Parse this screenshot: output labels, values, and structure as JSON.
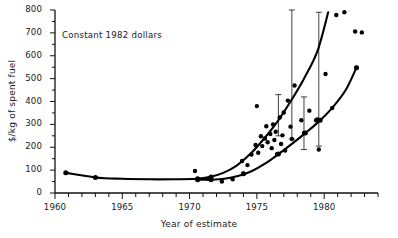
{
  "chart_data": {
    "type": "scatter",
    "title": "",
    "annotation": "Constant 1982 dollars",
    "xlabel": "Year of estimate",
    "ylabel": "$/kg of spent fuel",
    "xlim": [
      1960,
      1984
    ],
    "ylim": [
      0,
      800
    ],
    "xticks_major": [
      1960,
      1965,
      1970,
      1975,
      1980
    ],
    "xticks_minor_interval": 1,
    "yticks_major": [
      0,
      100,
      200,
      300,
      400,
      500,
      600,
      700,
      800
    ],
    "yticks_minor_interval": 50,
    "grid": false,
    "legend": "none",
    "axis_color": "#111111",
    "series": [
      {
        "name": "upper-trend-curve",
        "type": "line",
        "x": [
          1960.8,
          1963.0,
          1965.0,
          1967.0,
          1969.0,
          1970.5,
          1971.5,
          1972.5,
          1973.5,
          1974.5,
          1975.5,
          1976.5,
          1977.5,
          1978.5,
          1979.5,
          1980.3
        ],
        "y": [
          88,
          68,
          62,
          60,
          60,
          62,
          70,
          88,
          120,
          170,
          235,
          310,
          400,
          500,
          620,
          790
        ],
        "markers_at": [
          [
            1960.8,
            88
          ],
          [
            1963.0,
            68
          ],
          [
            1970.6,
            62
          ],
          [
            1971.6,
            70
          ]
        ]
      },
      {
        "name": "lower-trend-curve",
        "type": "line",
        "x": [
          1970.6,
          1971.6,
          1972.6,
          1973.6,
          1974.6,
          1975.6,
          1976.6,
          1977.6,
          1978.6,
          1979.6,
          1980.6,
          1981.6,
          1982.4
        ],
        "y": [
          58,
          58,
          62,
          74,
          95,
          128,
          170,
          215,
          262,
          312,
          372,
          450,
          548
        ],
        "markers_at": [
          [
            1970.6,
            58
          ],
          [
            1971.6,
            58
          ],
          [
            1974.0,
            84
          ],
          [
            1976.6,
            170
          ],
          [
            1978.6,
            262
          ],
          [
            1979.7,
            318
          ],
          [
            1982.4,
            548
          ]
        ]
      },
      {
        "name": "cost-estimate-points",
        "type": "scatter",
        "points": [
          [
            1970.4,
            96
          ],
          [
            1971.4,
            62
          ],
          [
            1972.4,
            50
          ],
          [
            1973.2,
            60
          ],
          [
            1974.0,
            84
          ],
          [
            1974.3,
            122
          ],
          [
            1974.6,
            168
          ],
          [
            1974.9,
            210
          ],
          [
            1975.1,
            176
          ],
          [
            1975.3,
            248
          ],
          [
            1975.4,
            205
          ],
          [
            1975.6,
            238
          ],
          [
            1975.7,
            292
          ],
          [
            1975.8,
            222
          ],
          [
            1976.0,
            258
          ],
          [
            1976.1,
            196
          ],
          [
            1976.2,
            300
          ],
          [
            1976.3,
            232
          ],
          [
            1976.4,
            268
          ],
          [
            1976.5,
            170
          ],
          [
            1976.7,
            330
          ],
          [
            1976.8,
            214
          ],
          [
            1976.9,
            252
          ],
          [
            1977.0,
            352
          ],
          [
            1977.1,
            186
          ],
          [
            1977.3,
            404
          ],
          [
            1977.5,
            290
          ],
          [
            1977.6,
            236
          ],
          [
            1977.8,
            470
          ],
          [
            1978.3,
            318
          ],
          [
            1978.5,
            262
          ],
          [
            1978.9,
            360
          ],
          [
            1979.4,
            318
          ],
          [
            1979.5,
            322
          ],
          [
            1979.6,
            190
          ],
          [
            1980.1,
            520
          ],
          [
            1980.6,
            372
          ],
          [
            1980.9,
            778
          ],
          [
            1981.5,
            790
          ],
          [
            1982.3,
            706
          ],
          [
            1982.8,
            702
          ],
          [
            1982.4,
            548
          ],
          [
            1973.9,
            140
          ],
          [
            1975.0,
            380
          ]
        ]
      }
    ],
    "error_bars": [
      {
        "x": 1976.6,
        "y": 330,
        "low": 250,
        "high": 430
      },
      {
        "x": 1977.6,
        "y": 400,
        "low": 236,
        "high": 800
      },
      {
        "x": 1978.5,
        "y": 300,
        "low": 190,
        "high": 420
      },
      {
        "x": 1979.6,
        "y": 420,
        "low": 205,
        "high": 790
      }
    ]
  }
}
